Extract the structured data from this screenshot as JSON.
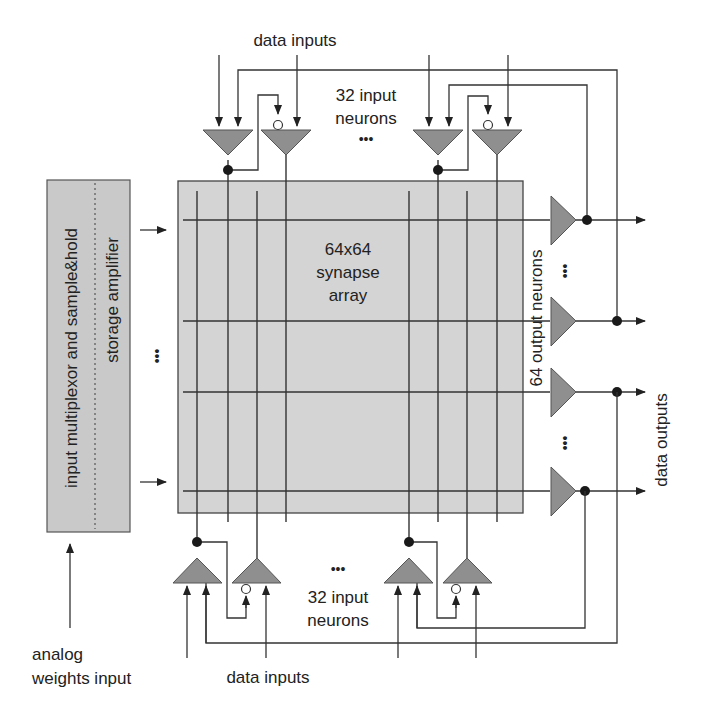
{
  "diagram": {
    "type": "neural-network-chip-block-diagram",
    "labels": {
      "top_data_inputs": "data inputs",
      "top_input_neurons_line1": "32 input",
      "top_input_neurons_line2": "neurons",
      "top_ellipsis": "•••",
      "array_line1": "64x64",
      "array_line2": "synapse",
      "array_line3": "array",
      "output_neurons": "64  output  neurons",
      "output_ellipsis": "•••",
      "data_outputs": "data outputs",
      "bottom_ellipsis": "•••",
      "bottom_input_neurons_line1": "32 input",
      "bottom_input_neurons_line2": "neurons",
      "bottom_data_inputs": "data inputs",
      "left_block_main": "input multiplexor and sample&hold",
      "left_block_sub": "storage amplifier",
      "left_ellipsis": "•••",
      "analog_line1": "analog",
      "analog_line2": "weights input"
    },
    "components": {
      "synapse_array": {
        "rows": 64,
        "cols": 64
      },
      "input_neurons_top": 32,
      "input_neurons_bottom": 32,
      "output_neurons": 64
    },
    "colors": {
      "array_fill": "#d4d4d4",
      "left_block_fill": "#c9c9c9",
      "neuron_fill": "#8f8f8f",
      "line": "#333333"
    }
  }
}
